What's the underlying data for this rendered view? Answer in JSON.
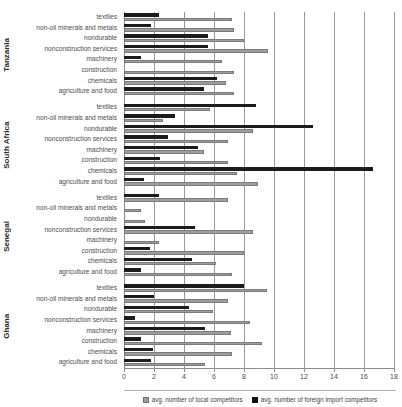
{
  "title": "",
  "legend": {
    "position": "bottom-center",
    "items": [
      {
        "key": "local",
        "label": "avg. number of local competitors",
        "color": "#9d9d9d"
      },
      {
        "key": "foreign",
        "label": "avg. number of foreign import competitors",
        "color": "#111111"
      }
    ]
  },
  "axis": {
    "x_ticks": [
      "0",
      "2",
      "4",
      "6",
      "8",
      "10",
      "12",
      "14",
      "16",
      "18"
    ],
    "x_min": 0,
    "x_max": 18
  },
  "chart_data": {
    "type": "bar",
    "orientation": "horizontal",
    "title": "",
    "xlabel": "",
    "ylabel": "",
    "xlim": [
      0,
      18
    ],
    "grid": true,
    "legend_position": "bottom-center",
    "categories": [
      "textiles",
      "non-oil minerals and metals",
      "nondurable",
      "nonconstruction services",
      "machinery",
      "construction",
      "chemicals",
      "agriculture and food"
    ],
    "series": [
      {
        "name": "avg. number of local competitors",
        "color": "#9d9d9d"
      },
      {
        "name": "avg. number of foreign import competitors",
        "color": "#111111"
      }
    ],
    "groups": [
      {
        "name": "Tanzania",
        "local": [
          7.2,
          7.3,
          8.0,
          9.6,
          6.5,
          7.3,
          6.8,
          7.3
        ],
        "foreign": [
          2.3,
          1.8,
          5.6,
          5.6,
          1.1,
          0.0,
          6.2,
          5.3
        ]
      },
      {
        "name": "South Africa",
        "local": [
          5.7,
          2.6,
          8.6,
          6.9,
          5.3,
          6.9,
          7.5,
          8.9
        ],
        "foreign": [
          8.8,
          3.4,
          12.6,
          2.9,
          4.9,
          2.4,
          16.6,
          1.3
        ]
      },
      {
        "name": "Senegal",
        "local": [
          6.9,
          1.1,
          1.4,
          8.6,
          2.3,
          8.0,
          6.1,
          7.2
        ],
        "foreign": [
          2.3,
          0.0,
          0.0,
          4.7,
          0.0,
          1.7,
          4.5,
          1.1
        ]
      },
      {
        "name": "Ghana",
        "local": [
          9.5,
          6.9,
          5.9,
          8.4,
          7.1,
          9.2,
          7.2,
          5.4
        ],
        "foreign": [
          8.0,
          2.0,
          4.3,
          0.7,
          5.4,
          1.1,
          1.9,
          1.8
        ]
      }
    ]
  }
}
